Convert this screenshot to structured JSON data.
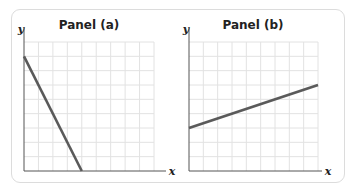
{
  "chart_data": [
    {
      "type": "line",
      "title": "Panel (a)",
      "xlabel": "x",
      "ylabel": "y",
      "grid": true,
      "xlim": [
        0,
        9
      ],
      "ylim": [
        0,
        9
      ],
      "series": [
        {
          "name": "line",
          "x": [
            0,
            4
          ],
          "y": [
            8,
            0
          ]
        }
      ]
    },
    {
      "type": "line",
      "title": "Panel (b)",
      "xlabel": "x",
      "ylabel": "y",
      "grid": true,
      "xlim": [
        0,
        9
      ],
      "ylim": [
        0,
        9
      ],
      "series": [
        {
          "name": "line",
          "x": [
            0,
            9
          ],
          "y": [
            3,
            6
          ]
        }
      ]
    }
  ],
  "colors": {
    "line": "#5a5a5a",
    "grid": "#e2e2e2",
    "axis": "#555555",
    "frame": "#dcdcdc"
  }
}
